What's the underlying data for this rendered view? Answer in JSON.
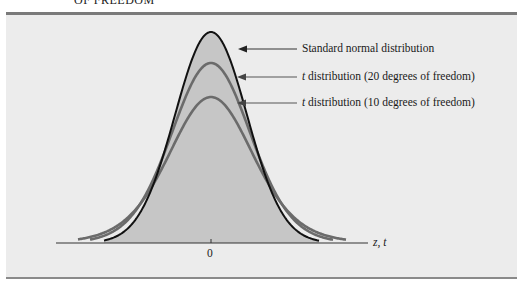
{
  "header": {
    "cut_title": "OF FREEDOM"
  },
  "chart_data": {
    "type": "line",
    "xlabel": "z, t",
    "ylabel": "",
    "x_ticks": [
      "0"
    ],
    "grid": false,
    "legend_position": "right (annotation arrows)",
    "series": [
      {
        "name": "Standard normal distribution",
        "label_prefix": "",
        "label_text": "Standard normal distribution",
        "df": null,
        "color": "#111111",
        "filled": true,
        "fill_color": "#c6c6c6",
        "peak_density": 0.399
      },
      {
        "name": "t distribution (20 degrees of freedom)",
        "label_prefix": "t",
        "label_text": " distribution (20 degrees of freedom)",
        "df": 20,
        "color": "#6b6b6b",
        "filled": false,
        "peak_density": 0.394
      },
      {
        "name": "t distribution (10 degrees of freedom)",
        "label_prefix": "t",
        "label_text": " distribution (10 degrees of freedom)",
        "df": 10,
        "color": "#6b6b6b",
        "filled": false,
        "peak_density": 0.389
      }
    ]
  },
  "colors": {
    "panel_bg": "#ececec",
    "rule": "#7a7a7a",
    "normal_curve": "#111111",
    "t_curves": "#6b6b6b",
    "fill": "#c6c6c6"
  }
}
